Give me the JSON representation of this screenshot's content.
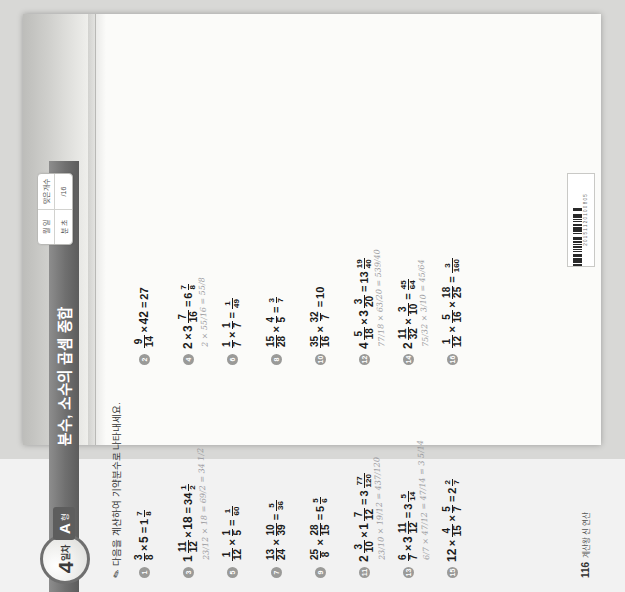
{
  "document": {
    "type": "korean-math-workbook-page",
    "page_number": "116",
    "footer_note": "계산왕 신 연산",
    "barcode_label": "2 0 1 5 1 1 2 0 1 0 0 8 0 5"
  },
  "header": {
    "day_number": "4",
    "day_unit": "일차",
    "form_letter": "A",
    "form_word": "형",
    "title": "분수, 소수의 곱셈 종합",
    "score_box": {
      "r1c1": "월  일",
      "r1c2": "맞은 개수",
      "r2c1": "분  초",
      "r2c2": "/16"
    }
  },
  "instruction": {
    "icon": "pencil-icon",
    "text": "다음을 계산하여 기약분수로 나타내세요."
  },
  "problems": [
    {
      "no": "1",
      "left": [
        {
          "t": "frac",
          "n": "3",
          "d": "8"
        },
        {
          "t": "op",
          "v": "×"
        },
        {
          "t": "num",
          "v": "5"
        }
      ],
      "answer": [
        {
          "t": "mixed",
          "w": "1",
          "n": "7",
          "d": "8"
        }
      ],
      "work": ""
    },
    {
      "no": "2",
      "left": [
        {
          "t": "frac",
          "n": "9",
          "d": "14"
        },
        {
          "t": "op",
          "v": "×"
        },
        {
          "t": "num",
          "v": "42"
        }
      ],
      "answer": [
        {
          "t": "num",
          "v": "27"
        }
      ],
      "work": ""
    },
    {
      "no": "3",
      "left": [
        {
          "t": "mixed",
          "w": "1",
          "n": "11",
          "d": "12"
        },
        {
          "t": "op",
          "v": "×"
        },
        {
          "t": "num",
          "v": "18"
        }
      ],
      "answer": [
        {
          "t": "mixed",
          "w": "34",
          "n": "1",
          "d": "2"
        }
      ],
      "work": "23/12 × 18 = 69/2 = 34 1/2"
    },
    {
      "no": "4",
      "left": [
        {
          "t": "num",
          "v": "2"
        },
        {
          "t": "op",
          "v": "×"
        },
        {
          "t": "mixed",
          "w": "3",
          "n": "7",
          "d": "16"
        }
      ],
      "answer": [
        {
          "t": "mixed",
          "w": "6",
          "n": "7",
          "d": "8"
        }
      ],
      "work": "2 × 55/16 = 55/8"
    },
    {
      "no": "5",
      "left": [
        {
          "t": "frac",
          "n": "1",
          "d": "12"
        },
        {
          "t": "op",
          "v": "×"
        },
        {
          "t": "frac",
          "n": "1",
          "d": "5"
        }
      ],
      "answer": [
        {
          "t": "frac",
          "n": "1",
          "d": "60"
        }
      ],
      "work": ""
    },
    {
      "no": "6",
      "left": [
        {
          "t": "frac",
          "n": "1",
          "d": "7"
        },
        {
          "t": "op",
          "v": "×"
        },
        {
          "t": "frac",
          "n": "1",
          "d": "7"
        }
      ],
      "answer": [
        {
          "t": "frac",
          "n": "1",
          "d": "49"
        }
      ],
      "work": ""
    },
    {
      "no": "7",
      "left": [
        {
          "t": "frac",
          "n": "13",
          "d": "24"
        },
        {
          "t": "op",
          "v": "×"
        },
        {
          "t": "frac",
          "n": "10",
          "d": "39"
        }
      ],
      "answer": [
        {
          "t": "frac",
          "n": "5",
          "d": "36"
        }
      ],
      "work": ""
    },
    {
      "no": "8",
      "left": [
        {
          "t": "frac",
          "n": "15",
          "d": "28"
        },
        {
          "t": "op",
          "v": "×"
        },
        {
          "t": "frac",
          "n": "4",
          "d": "5"
        }
      ],
      "answer": [
        {
          "t": "frac",
          "n": "3",
          "d": "7"
        }
      ],
      "work": ""
    },
    {
      "no": "9",
      "left": [
        {
          "t": "frac",
          "n": "25",
          "d": "8"
        },
        {
          "t": "op",
          "v": "×"
        },
        {
          "t": "frac",
          "n": "28",
          "d": "15"
        }
      ],
      "answer": [
        {
          "t": "mixed",
          "w": "5",
          "n": "5",
          "d": "6"
        }
      ],
      "work": ""
    },
    {
      "no": "10",
      "left": [
        {
          "t": "frac",
          "n": "35",
          "d": "16"
        },
        {
          "t": "op",
          "v": "×"
        },
        {
          "t": "frac",
          "n": "32",
          "d": "7"
        }
      ],
      "answer": [
        {
          "t": "num",
          "v": "10"
        }
      ],
      "work": ""
    },
    {
      "no": "11",
      "left": [
        {
          "t": "mixed",
          "w": "2",
          "n": "3",
          "d": "10"
        },
        {
          "t": "op",
          "v": "×"
        },
        {
          "t": "mixed",
          "w": "1",
          "n": "7",
          "d": "12"
        }
      ],
      "answer": [
        {
          "t": "mixed",
          "w": "3",
          "n": "77",
          "d": "120"
        }
      ],
      "work": "23/10 × 19/12 = 437/120"
    },
    {
      "no": "12",
      "left": [
        {
          "t": "mixed",
          "w": "4",
          "n": "5",
          "d": "18"
        },
        {
          "t": "op",
          "v": "×"
        },
        {
          "t": "mixed",
          "w": "3",
          "n": "3",
          "d": "20"
        }
      ],
      "answer": [
        {
          "t": "mixed",
          "w": "13",
          "n": "19",
          "d": "40"
        }
      ],
      "work": "77/18 × 63/20 = 539/40"
    },
    {
      "no": "13",
      "left": [
        {
          "t": "frac",
          "n": "6",
          "d": "7"
        },
        {
          "t": "op",
          "v": "×"
        },
        {
          "t": "mixed",
          "w": "3",
          "n": "11",
          "d": "12"
        }
      ],
      "answer": [
        {
          "t": "mixed",
          "w": "3",
          "n": "5",
          "d": "14"
        }
      ],
      "work": "6/7 × 47/12 = 47/14 = 3 5/14"
    },
    {
      "no": "14",
      "left": [
        {
          "t": "mixed",
          "w": "2",
          "n": "11",
          "d": "32"
        },
        {
          "t": "op",
          "v": "×"
        },
        {
          "t": "frac",
          "n": "3",
          "d": "10"
        }
      ],
      "answer": [
        {
          "t": "frac",
          "n": "45",
          "d": "64"
        }
      ],
      "work": "75/32 × 3/10 = 45/64"
    },
    {
      "no": "15",
      "left": [
        {
          "t": "num",
          "v": "12"
        },
        {
          "t": "op",
          "v": "×"
        },
        {
          "t": "frac",
          "n": "4",
          "d": "15"
        },
        {
          "t": "op",
          "v": "×"
        },
        {
          "t": "frac",
          "n": "5",
          "d": "7"
        }
      ],
      "answer": [
        {
          "t": "mixed",
          "w": "2",
          "n": "2",
          "d": "7"
        }
      ],
      "work": ""
    },
    {
      "no": "16",
      "left": [
        {
          "t": "frac",
          "n": "1",
          "d": "12"
        },
        {
          "t": "op",
          "v": "×"
        },
        {
          "t": "frac",
          "n": "5",
          "d": "16"
        },
        {
          "t": "op",
          "v": "×"
        },
        {
          "t": "frac",
          "n": "18",
          "d": "25"
        }
      ],
      "answer": [
        {
          "t": "frac",
          "n": "3",
          "d": "160"
        }
      ],
      "work": ""
    }
  ],
  "colors": {
    "header_bar": "#6f6f6f",
    "badge": "#5d5d5d",
    "paper": "#fbfbf9",
    "scan_bg": "#d8d8d6",
    "ink": "#1a1a1a",
    "pencil": "#8e8e93"
  }
}
